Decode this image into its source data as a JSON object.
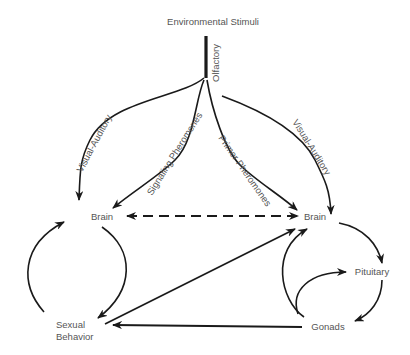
{
  "diagram": {
    "nodes": {
      "environmental_stimuli": "Environmental Stimuli",
      "brain_left": "Brain",
      "brain_right": "Brain",
      "pituitary": "Pituitary",
      "gonads": "Gonads",
      "sexual_behavior_line1": "Sexual",
      "sexual_behavior_line2": "Behavior"
    },
    "edge_labels": {
      "olfactory": "Olfactory",
      "visual_auditory_left": "Visual-Auditory",
      "signaling_pheromones": "Signaling Pheromones",
      "primer_pheromones": "Primer Pheromones",
      "visual_auditory_right": "Visual-Auditory"
    },
    "colors": {
      "stroke": "#1a1a1a",
      "text": "#555555",
      "background": "#ffffff"
    }
  }
}
